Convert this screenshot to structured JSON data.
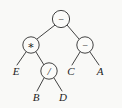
{
  "figure": {
    "kind": "expression-tree",
    "background_color": "#f9f9f7",
    "ink_color": "#2e2e2e",
    "width": 122,
    "height": 108
  },
  "tree": {
    "nodes": [
      {
        "id": "root",
        "label": "−",
        "icon": "minus-operator",
        "shape": "circle",
        "cx": 61,
        "cy": 19,
        "r": 8.6
      },
      {
        "id": "mul",
        "label": "∗",
        "icon": "asterisk-operator",
        "shape": "circle",
        "cx": 31,
        "cy": 45,
        "r": 8.2
      },
      {
        "id": "sub2",
        "label": "−",
        "icon": "minus-operator",
        "shape": "circle",
        "cx": 85,
        "cy": 45,
        "r": 8.2
      },
      {
        "id": "div",
        "label": "/",
        "icon": "slash-operator",
        "shape": "circle",
        "cx": 49,
        "cy": 71,
        "r": 8.2
      }
    ],
    "leaves": [
      {
        "id": "leaf-e",
        "label": "E",
        "x": 16,
        "y": 75
      },
      {
        "id": "leaf-b",
        "label": "B",
        "x": 36,
        "y": 101
      },
      {
        "id": "leaf-d",
        "label": "D",
        "x": 63,
        "y": 101
      },
      {
        "id": "leaf-c",
        "label": "C",
        "x": 71,
        "y": 75
      },
      {
        "id": "leaf-a",
        "label": "A",
        "x": 100,
        "y": 75
      }
    ],
    "edges": [
      {
        "id": "edge-root-mul",
        "from": "root",
        "to": "mul",
        "x1": 55,
        "y1": 25,
        "x2": 37,
        "y2": 39
      },
      {
        "id": "edge-root-sub2",
        "from": "root",
        "to": "sub2",
        "x1": 67,
        "y1": 25,
        "x2": 79,
        "y2": 39
      },
      {
        "id": "edge-mul-e",
        "from": "mul",
        "to": "leaf-e",
        "x1": 26,
        "y1": 52,
        "x2": 17,
        "y2": 65
      },
      {
        "id": "edge-mul-div",
        "from": "mul",
        "to": "div",
        "x1": 36,
        "y1": 52,
        "x2": 44,
        "y2": 65
      },
      {
        "id": "edge-div-b",
        "from": "div",
        "to": "leaf-b",
        "x1": 44,
        "y1": 78,
        "x2": 37,
        "y2": 91
      },
      {
        "id": "edge-div-d",
        "from": "div",
        "to": "leaf-d",
        "x1": 54,
        "y1": 78,
        "x2": 62,
        "y2": 91
      },
      {
        "id": "edge-sub2-c",
        "from": "sub2",
        "to": "leaf-c",
        "x1": 80,
        "y1": 52,
        "x2": 72,
        "y2": 65
      },
      {
        "id": "edge-sub2-a",
        "from": "sub2",
        "to": "leaf-a",
        "x1": 90,
        "y1": 52,
        "x2": 99,
        "y2": 65
      }
    ]
  }
}
